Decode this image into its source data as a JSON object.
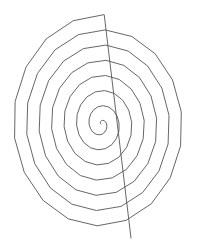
{
  "figure": {
    "background": "#ffffff",
    "stroke_color": "#555555",
    "width": 204,
    "height": 247
  },
  "spiral": {
    "center": [
      101,
      124
    ],
    "turns": 7.2,
    "x_spacing_per_turn": 12.6,
    "y_spacing_per_turn": 15.2,
    "start_angle_deg": 200,
    "end_point": [
      131,
      238
    ],
    "segments_per_turn": 18
  }
}
